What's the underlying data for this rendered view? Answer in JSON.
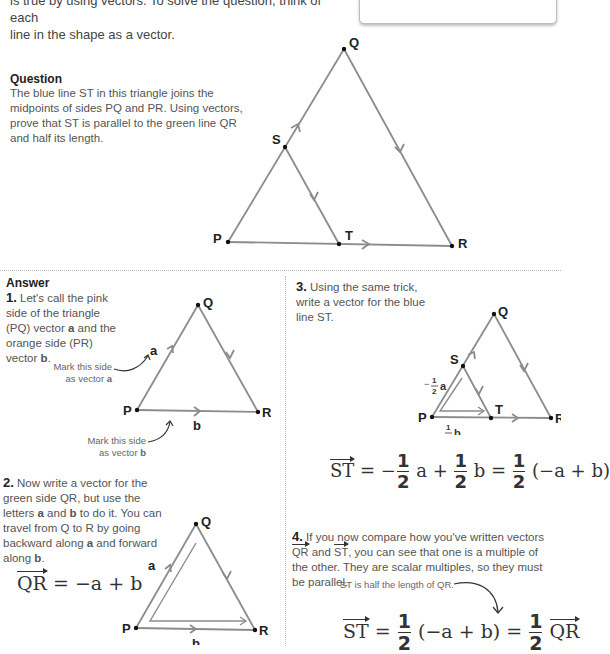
{
  "intro": {
    "line1": "is true by using vectors. To solve the question, think of each",
    "line2": "line in the shape as a vector."
  },
  "question": {
    "heading": "Question",
    "text": "The blue line ST in this triangle joins the midpoints of sides PQ and PR. Using vectors, prove that ST is parallel to the green line QR and half its length.",
    "labels": {
      "P": "P",
      "Q": "Q",
      "R": "R",
      "S": "S",
      "T": "T"
    }
  },
  "answer": {
    "heading": "Answer",
    "step1": {
      "num": "1.",
      "text_pre": "Let's call the pink side of the triangle (PQ) vector ",
      "a": "a",
      "text_mid": " and the orange side (PR) vector ",
      "b": "b",
      "text_end": ".",
      "note_a_line1": "Mark this side",
      "note_a_line2": "as vector ",
      "note_a_bold": "a",
      "note_b_line1": "Mark this side",
      "note_b_line2": "as vector ",
      "note_b_bold": "b",
      "labels": {
        "P": "P",
        "Q": "Q",
        "R": "R",
        "a": "a",
        "b": "b"
      }
    },
    "step2": {
      "num": "2.",
      "text_pre": "Now write a vector for the green side QR, but use the letters ",
      "a": "a",
      "text_and": " and ",
      "b": "b",
      "text_mid": " to do it. You can travel from Q to R by going backward along ",
      "a2": "a",
      "text_mid2": " and forward along ",
      "b2": "b",
      "text_end": ".",
      "formula_lhs": "QR",
      "formula_rhs": " = −a + b",
      "labels": {
        "P": "P",
        "Q": "Q",
        "R": "R",
        "a": "a",
        "b": "b"
      }
    },
    "step3": {
      "num": "3.",
      "text": "Using the same trick, write a vector for the blue line ST.",
      "labels": {
        "P": "P",
        "Q": "Q",
        "R": "R",
        "S": "S",
        "T": "T",
        "half_a": "a",
        "half_b": "b",
        "minus": "−",
        "one": "1",
        "two": "2"
      },
      "formula": {
        "lhs": "ST",
        "eq1": " = −",
        "f_num": "1",
        "f_den": "2",
        "t1": " a + ",
        "t2": " b = ",
        "t3": " (−a + b)"
      }
    },
    "step4": {
      "num": "4.",
      "text_pre": "If you now compare how you've written vectors ",
      "qr": "QR",
      "text_and": " and ",
      "st": "ST",
      "text_end": ", you can see that one is a multiple of the other. They are scalar multiples, so they must be parallel.",
      "note": "ST is half the length of QR.",
      "formula": {
        "lhs": "ST",
        "eq1": " = ",
        "f_num": "1",
        "f_den": "2",
        "mid": " (−a + b) = ",
        "rhs": "QR"
      }
    }
  },
  "colors": {
    "line": "#8c8c8c",
    "text": "#444444",
    "divider": "#bbbbbb"
  }
}
